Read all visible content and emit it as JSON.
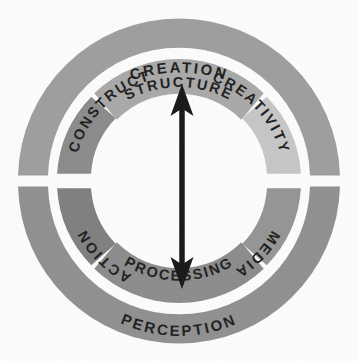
{
  "diagram": {
    "type": "concentric-ring-wheel",
    "center": {
      "x": 179,
      "y": 181
    },
    "geometry": {
      "outer_ring": {
        "r_outer": 161,
        "r_inner": 131
      },
      "inner_ring": {
        "r_outer": 122,
        "r_inner": 88
      },
      "gap_degrees": 3
    },
    "outer_ring": {
      "name": "outer-ring",
      "segments": [
        {
          "id": "creation",
          "label": "CREATION",
          "color": "#9d9d9d",
          "start_deg": 182,
          "end_deg": 358,
          "text_offset_deg": 270,
          "side": "top"
        },
        {
          "id": "perception",
          "label": "PERCEPTION",
          "color": "#8f8f8f",
          "start_deg": 2,
          "end_deg": 178,
          "text_offset_deg": 90,
          "side": "bottom"
        }
      ]
    },
    "inner_ring": {
      "name": "inner-ring",
      "segments": [
        {
          "id": "structure",
          "label": "STRUCTURE",
          "color": "#a8a8a8",
          "start_deg": 226,
          "end_deg": 314,
          "quadrant": "top"
        },
        {
          "id": "creativity",
          "label": "CREATIVITY",
          "color": "#c6c6c6",
          "start_deg": 316,
          "end_deg": 358,
          "quadrant": "top-right"
        },
        {
          "id": "media",
          "label": "MEDIA",
          "color": "#949494",
          "start_deg": 2,
          "end_deg": 44,
          "quadrant": "bottom-right"
        },
        {
          "id": "processing",
          "label": "PROCESSING",
          "color": "#8b8b8b",
          "start_deg": 46,
          "end_deg": 134,
          "quadrant": "bottom"
        },
        {
          "id": "action",
          "label": "ACTION",
          "color": "#7e7e7e",
          "start_deg": 136,
          "end_deg": 178,
          "quadrant": "bottom-left"
        },
        {
          "id": "construct",
          "label": "CONSTRUCT",
          "color": "#8a8a8a",
          "start_deg": 182,
          "end_deg": 224,
          "quadrant": "top-left"
        }
      ]
    },
    "center_arrow": {
      "name": "vertical-double-arrow",
      "orientation": "vertical",
      "double_headed": true,
      "color": "#151515",
      "top_y": 85,
      "bottom_y": 288,
      "x": 182,
      "head_width": 22,
      "head_length": 30
    },
    "background_color": "#fdfdfd"
  }
}
